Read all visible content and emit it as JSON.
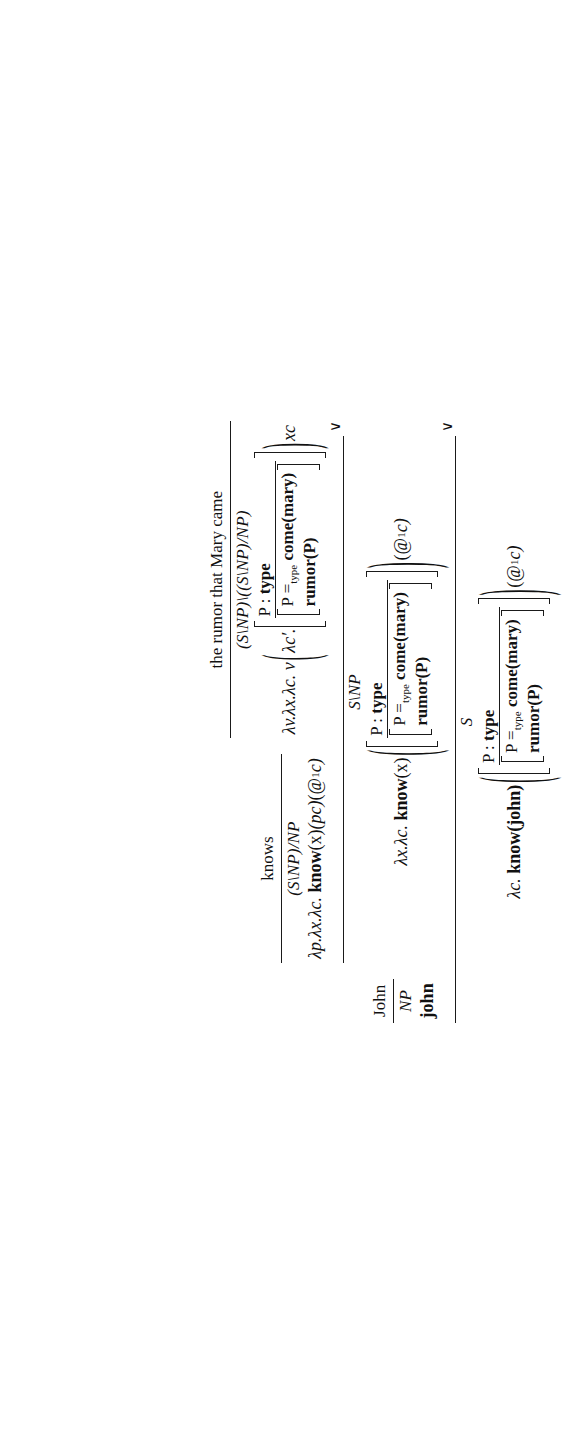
{
  "figure": {
    "kind": "ccg-derivation",
    "orientation": "rotated-90-ccw",
    "caption": ""
  },
  "leaves": [
    {
      "id": "john",
      "word": "John",
      "category": "NP",
      "semantics": "john"
    },
    {
      "id": "knows",
      "word": "knows",
      "category": "(S\\NP)/NP",
      "semantics": "λp.λx.λc. know(x)(pc)(@₁1c)"
    },
    {
      "id": "the-rumor-that-mary-came",
      "word": "the rumor that Mary came",
      "category": "(S\\NP)\\((S\\NP)/NP)",
      "semantics": "λv.λx.λc. v ( λc′. [ P : type | P =type come(mary) ; rumor(P) ] ) xc"
    }
  ],
  "semantics_parts": {
    "knows": {
      "lambda_prefix": "λp.λx.λc.",
      "head": "know",
      "arg_x": "(x)",
      "arg_pc": "(pc)",
      "arg_at": "(@",
      "at_sub": "1",
      "at_tail": "c)"
    },
    "rumor_fn": {
      "lambda_prefix": "λv.λx.λc.",
      "var": "v",
      "inner_lambda": "λc′.",
      "tail": "xc"
    },
    "know_x": {
      "lambda_prefix": "λx.λc.",
      "head": "know",
      "arg_x": "(x)",
      "at_open": "(@",
      "at_sub": "1",
      "at_tail": "c)"
    },
    "know_john": {
      "lambda_prefix": "λc.",
      "head": "know",
      "arg_x": "(john)",
      "at_open": "(@",
      "at_sub": "1",
      "at_tail": "c)"
    },
    "drs": {
      "universe_var": "P",
      "universe_sep": " : ",
      "universe_type": "type",
      "cond1_lhs": "P ",
      "cond1_eq": "=",
      "cond1_eq_sub": "type",
      "cond1_rhs": " come(mary)",
      "cond2": "rumor(P)"
    }
  },
  "nodes": {
    "vp": {
      "category": "S\\NP",
      "rule": "∨"
    },
    "s": {
      "category": "S",
      "rule": "∨"
    }
  },
  "rules": {
    "backward_application": "∨",
    "backward_crossed": "∨"
  },
  "categories": {
    "np": "NP",
    "tv": "(S\\NP)/NP",
    "rumor_arg": "(S\\NP)\\((S\\NP)/NP)",
    "vp": "S\\NP",
    "s": "S"
  },
  "words": {
    "john": "John",
    "knows": "knows",
    "rumor_phrase": "the rumor that Mary came"
  }
}
